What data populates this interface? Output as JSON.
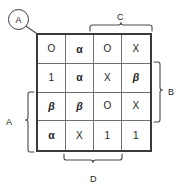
{
  "diagram": {
    "callout": {
      "label": "A",
      "name": "circled-callout-a"
    },
    "grid": {
      "rows": 4,
      "cols": 4,
      "cells": [
        [
          "O",
          "α",
          "O",
          "X"
        ],
        [
          "1",
          "α",
          "X",
          "β"
        ],
        [
          "β",
          "β",
          "O",
          "X"
        ],
        [
          "α",
          "X",
          "1",
          "1"
        ]
      ]
    },
    "brackets": {
      "top": {
        "label": "C",
        "spans_columns": [
          3,
          4
        ]
      },
      "right": {
        "label": "B",
        "spans_rows": [
          2,
          3
        ]
      },
      "left": {
        "label": "A",
        "spans_rows": [
          3,
          4
        ]
      },
      "bottom": {
        "label": "D",
        "spans_columns": [
          2,
          3
        ]
      }
    },
    "colors": {
      "outer_border": "#3a3a3a",
      "inner_grid": "#6f6f6f",
      "text": "#1c1c1c",
      "background": "#ffffff"
    }
  }
}
